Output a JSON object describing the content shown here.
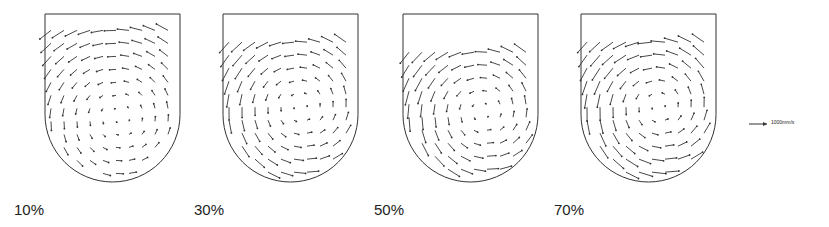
{
  "panels": [
    {
      "label": "10%",
      "x": 45,
      "cx": 0.55,
      "cy": 0.62,
      "strength": 0.6,
      "top_empty": 0.05
    },
    {
      "label": "30%",
      "x": 223,
      "cx": 0.58,
      "cy": 0.55,
      "strength": 0.8,
      "top_empty": 0.12
    },
    {
      "label": "50%",
      "x": 403,
      "cx": 0.6,
      "cy": 0.58,
      "strength": 0.9,
      "top_empty": 0.18
    },
    {
      "label": "70%",
      "x": 581,
      "cx": 0.58,
      "cy": 0.55,
      "strength": 1.0,
      "top_empty": 0.12
    }
  ],
  "labels_x": [
    14,
    194,
    374,
    554
  ],
  "scale": {
    "label": "1000mm/s"
  },
  "color": "#333333"
}
